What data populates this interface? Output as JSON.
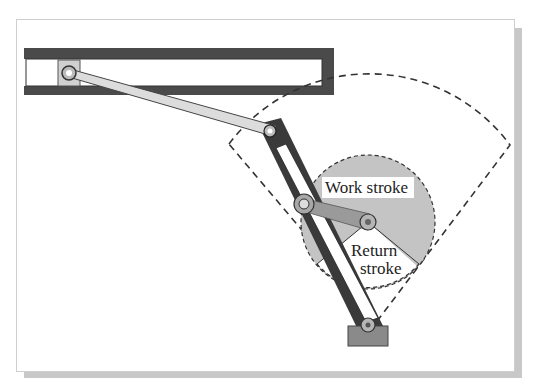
{
  "diagram": {
    "labels": {
      "work_stroke": "Work stroke",
      "return_stroke_line1": "Return",
      "return_stroke_line2": "stroke"
    },
    "colors": {
      "guide_rail": "#4a4a4a",
      "connecting_rod": "#d9d9d9",
      "lever": "#3a3a3a",
      "crank_circle": "#c4c4c4",
      "crank_arm": "#9a9a9a",
      "base": "#8a8a8a",
      "dashed": "#333333"
    }
  }
}
